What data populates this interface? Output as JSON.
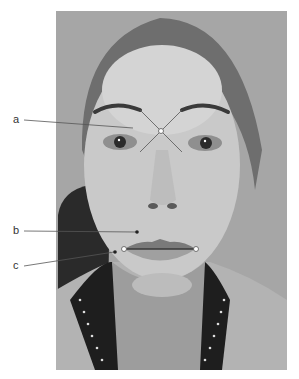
{
  "figure": {
    "type": "clinical facial photograph (grayscale) with annotation markers",
    "labels": [
      {
        "id": "a",
        "text": "a",
        "target": "glabella — intersection of lines connecting brows and inner canthi"
      },
      {
        "id": "b",
        "text": "b",
        "target": "upper lip / philtrum area"
      },
      {
        "id": "c",
        "text": "c",
        "target": "oral commissure (corner of mouth)"
      }
    ],
    "markers": {
      "glabella_cross": {
        "cx": 161,
        "cy": 131
      },
      "commissure_left": {
        "cx": 124,
        "cy": 249
      },
      "commissure_right": {
        "cx": 196,
        "cy": 249
      }
    },
    "colors": {
      "line": "#555555",
      "marker_fill": "#ffffff",
      "background": "#ffffff",
      "photo_bg": "#a5a5a5"
    }
  }
}
